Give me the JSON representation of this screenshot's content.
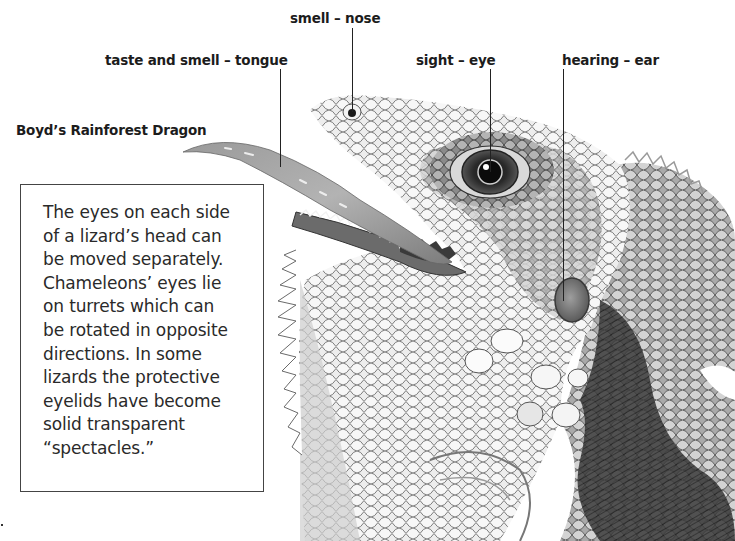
{
  "page": {
    "species_title": "Boyd’s Rainforest Dragon",
    "sense_labels": [
      {
        "id": "nose",
        "text": "smell – nose"
      },
      {
        "id": "tongue",
        "text": "taste and smell – tongue"
      },
      {
        "id": "eye",
        "text": "sight – eye"
      },
      {
        "id": "ear",
        "text": "hearing – ear"
      }
    ],
    "info_box": {
      "lines": [
        "The eyes on each side",
        "of a lizard’s head can",
        "be moved separately.",
        "Chameleons’ eyes lie",
        "on turrets which can",
        "be rotated in opposite",
        "directions. In some",
        "lizards the protective",
        "eyelids have become",
        "solid transparent",
        "“spectacles.”"
      ]
    },
    "illustration": {
      "subject": "lizard-head-illustration",
      "style": "grayscale pencil drawing"
    }
  }
}
